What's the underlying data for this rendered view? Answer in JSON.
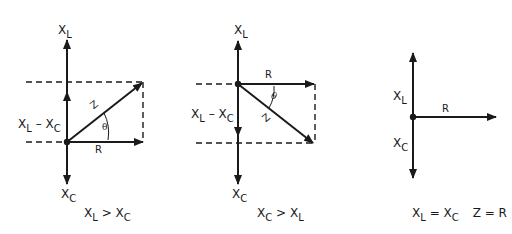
{
  "diagrams": [
    {
      "id": "xl-greater",
      "labels": {
        "top_main": "X",
        "top_sub": "L",
        "bottom_main": "X",
        "bottom_sub": "C",
        "side_a": "X",
        "side_a_sub": "L",
        "side_minus": " – ",
        "side_b": "X",
        "side_b_sub": "C",
        "resistance": "R",
        "impedance": "Z",
        "angle": "θ"
      },
      "caption": {
        "a": "X",
        "a_sub": "L",
        "op": " > ",
        "b": "X",
        "b_sub": "C"
      }
    },
    {
      "id": "xc-greater",
      "labels": {
        "top_main": "X",
        "top_sub": "L",
        "bottom_main": "X",
        "bottom_sub": "C",
        "side_a": "X",
        "side_a_sub": "L",
        "side_minus": " – ",
        "side_b": "X",
        "side_b_sub": "C",
        "resistance": "R",
        "impedance": "Z",
        "angle": "θ"
      },
      "caption": {
        "a": "X",
        "a_sub": "C",
        "op": " > ",
        "b": "X",
        "b_sub": "L"
      }
    },
    {
      "id": "xl-equals-xc",
      "labels": {
        "top_main": "X",
        "top_sub": "L",
        "bottom_main": "X",
        "bottom_sub": "C",
        "resistance": "R"
      },
      "caption": {
        "a": "X",
        "a_sub": "L",
        "op": " = ",
        "b": "X",
        "b_sub": "C",
        "extra": "Z = R"
      }
    }
  ],
  "colors": {
    "ink": "#1a1a1a",
    "background": "#ffffff"
  }
}
